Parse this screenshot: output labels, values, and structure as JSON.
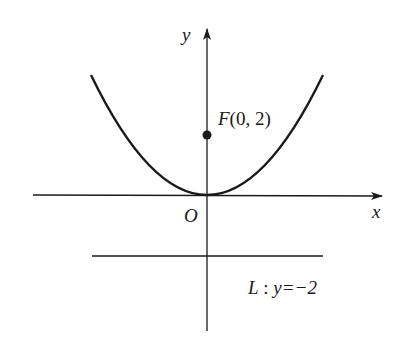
{
  "diagram": {
    "type": "parabola-focus-directrix",
    "axes": {
      "x_label": "x",
      "y_label": "y",
      "origin_label": "O"
    },
    "focus": {
      "label": "F(0, 2)",
      "name": "F",
      "coords": "(0, 2)"
    },
    "directrix": {
      "label": "L : y=−2",
      "name": "L",
      "equation": "y=−2"
    },
    "colors": {
      "stroke": "#1a1a1a",
      "background": "#ffffff"
    }
  }
}
